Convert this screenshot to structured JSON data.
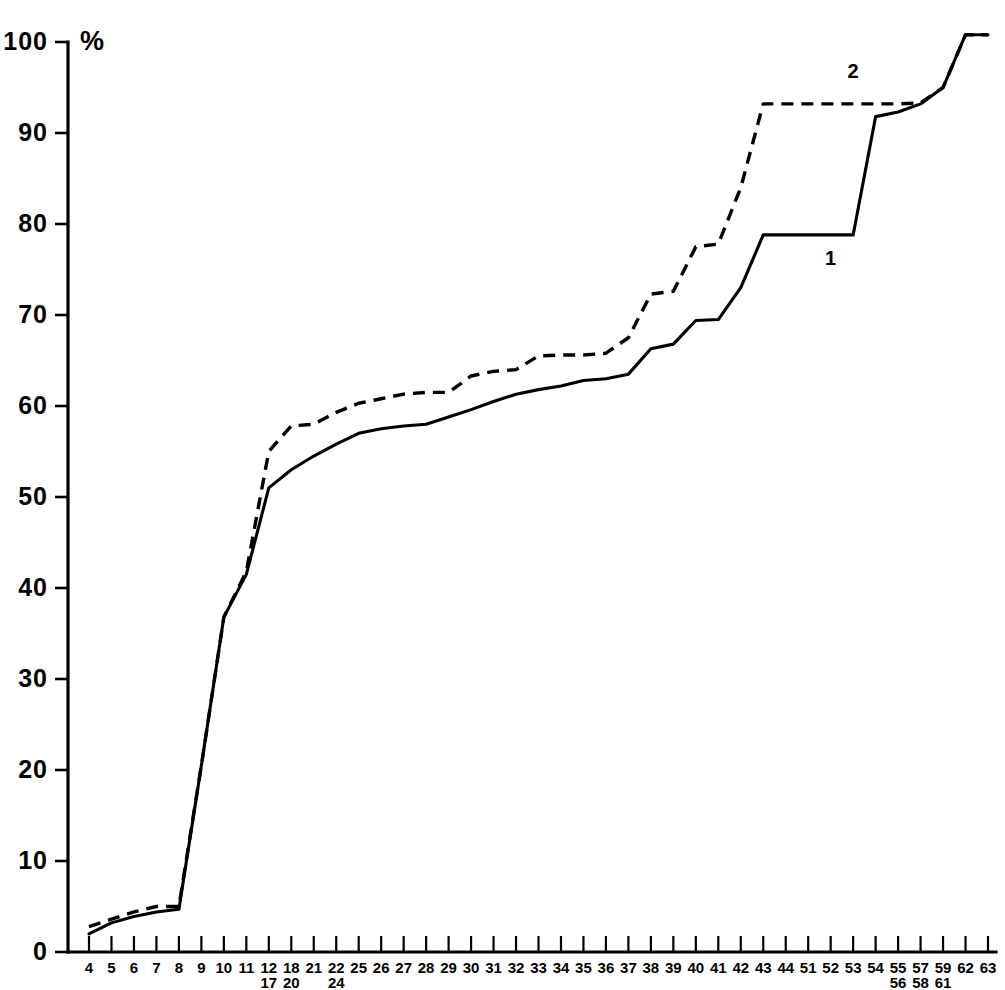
{
  "chart_data": {
    "type": "line",
    "title": "",
    "subtitle": "",
    "xlabel": "",
    "ylabel": "%",
    "ylim": [
      0,
      101
    ],
    "yticks": [
      0,
      10,
      20,
      30,
      40,
      50,
      60,
      70,
      80,
      90,
      100
    ],
    "ytick_labels": [
      "0",
      "10",
      "20",
      "30",
      "40",
      "50",
      "60",
      "70",
      "80",
      "90",
      "100"
    ],
    "grid": false,
    "legend_position": "inline-annotation",
    "axis_unit_label": "%",
    "categories": [
      "4",
      "5",
      "6",
      "7",
      "8",
      "9",
      "10",
      "11",
      "12",
      "18",
      "21",
      "22",
      "25",
      "26",
      "27",
      "28",
      "29",
      "30",
      "31",
      "32",
      "33",
      "34",
      "35",
      "36",
      "37",
      "38",
      "39",
      "40",
      "41",
      "42",
      "43",
      "44",
      "51",
      "52",
      "53",
      "54",
      "55",
      "57",
      "59",
      "62",
      "63"
    ],
    "category_sublabels": [
      "",
      "",
      "",
      "",
      "",
      "",
      "",
      "",
      "17",
      "20",
      "",
      "24",
      "",
      "",
      "",
      "",
      "",
      "",
      "",
      "",
      "",
      "",
      "",
      "",
      "",
      "",
      "",
      "",
      "",
      "",
      "",
      "",
      "",
      "",
      "",
      "",
      "56",
      "58",
      "61",
      "",
      ""
    ],
    "series": [
      {
        "name": "1",
        "style": "solid",
        "annotation_label": "1",
        "values": [
          2.0,
          3.2,
          3.9,
          4.4,
          4.7,
          20.5,
          36.8,
          41.5,
          51.0,
          53.0,
          54.5,
          55.8,
          57.0,
          57.5,
          57.8,
          58.0,
          58.8,
          59.6,
          60.5,
          61.3,
          61.8,
          62.2,
          62.8,
          63.0,
          63.5,
          66.3,
          66.8,
          69.4,
          69.5,
          73.0,
          78.8,
          78.8,
          78.8,
          78.8,
          78.8,
          91.8,
          92.3,
          93.2,
          95.0,
          100.8,
          100.8
        ]
      },
      {
        "name": "2",
        "style": "dashed",
        "annotation_label": "2",
        "values": [
          2.8,
          3.6,
          4.4,
          5.0,
          5.0,
          20.5,
          36.8,
          41.8,
          55.0,
          57.8,
          58.0,
          59.3,
          60.3,
          60.8,
          61.3,
          61.5,
          61.5,
          63.3,
          63.8,
          64.0,
          65.5,
          65.6,
          65.6,
          65.8,
          67.5,
          72.3,
          72.6,
          77.5,
          77.8,
          84.0,
          93.2,
          93.2,
          93.2,
          93.2,
          93.2,
          93.2,
          93.2,
          93.3,
          95.0,
          100.8,
          100.8
        ]
      }
    ],
    "annotations": [
      {
        "text": "1",
        "series": "1",
        "x_category": "52",
        "y_value": 75.5
      },
      {
        "text": "2",
        "series": "2",
        "x_category": "53",
        "y_value": 96.0
      }
    ]
  },
  "figure": {
    "background_color": "#ffffff",
    "ink_color": "#000000"
  }
}
